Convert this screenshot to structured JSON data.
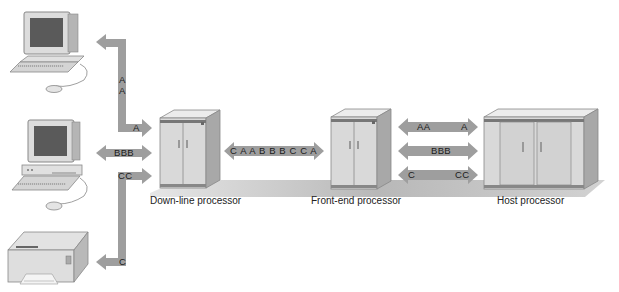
{
  "diagram": {
    "title": "",
    "nodes": [
      {
        "id": "terminal_a",
        "type": "computer-terminal"
      },
      {
        "id": "terminal_b",
        "type": "computer-terminal"
      },
      {
        "id": "printer_c",
        "type": "printer"
      },
      {
        "id": "downline",
        "label": "Down-line processor",
        "type": "processor-cabinet"
      },
      {
        "id": "frontend",
        "label": "Front-end processor",
        "type": "processor-cabinet"
      },
      {
        "id": "host",
        "label": "Host processor",
        "type": "processor-cabinet"
      }
    ],
    "arrows": {
      "terminal_a_link": {
        "vertical_text": [
          "A",
          "A"
        ],
        "bottom_text": "A"
      },
      "terminal_b_link": {
        "text": "BBB"
      },
      "printer_link": {
        "top_text": "CC",
        "bottom_text": "C"
      },
      "multiplexed_link": {
        "text": "C A A B B B C C A"
      },
      "host_link_a": {
        "left_text": "AA",
        "right_text": "A"
      },
      "host_link_b": {
        "text": "BBB"
      },
      "host_link_c": {
        "left_text": "C",
        "right_text": "CC"
      }
    },
    "colors": {
      "arrow": "#9e9e9e",
      "cabinet_front": "#d9d9d9",
      "cabinet_side": "#a8a8a8",
      "cabinet_top": "#ececec",
      "floor": "#bdbdbd",
      "monitor_screen": "#5a5a5a"
    }
  }
}
